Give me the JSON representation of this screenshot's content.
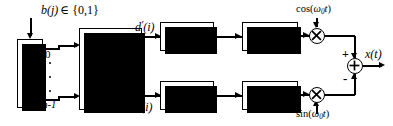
{
  "diagram": {
    "input_label": {
      "text": "b(j)",
      "member": "∈ {0,1}"
    },
    "sp_block": {
      "line1": "S",
      "line2": "/",
      "line3": "P"
    },
    "sp_outputs": {
      "top": "0",
      "bottom": "m-1"
    },
    "mapper_block": {
      "line1": "Signal-",
      "line2": "raum",
      "line3": "Zuordnung"
    },
    "branch_labels": {
      "top": {
        "base": "d",
        "prime": "′",
        "arg": "(i)"
      },
      "bottom": {
        "base": "d",
        "prime": "″",
        "arg": "(i)"
      }
    },
    "impulse_block": {
      "line1": "Impuls-",
      "line2": "generator"
    },
    "shaping_block": {
      "base": "g",
      "sub": "s",
      "arg": "(t)"
    },
    "carriers": {
      "top": {
        "fn": "cos(",
        "omega": "ω",
        "sub": "0",
        "t": "t",
        "close": ")"
      },
      "bottom": {
        "fn": "sin(",
        "omega": "ω",
        "sub": "0",
        "t": "t",
        "close": ")"
      }
    },
    "multiplier_symbol": "⊗",
    "summer": {
      "symbol": "⊕",
      "plus": "+",
      "minus": "-"
    },
    "output_label": {
      "base": "x",
      "arg": "(t)"
    },
    "colors": {
      "line": "#000000",
      "background": "#ffffff",
      "shadow": "#000000"
    }
  }
}
